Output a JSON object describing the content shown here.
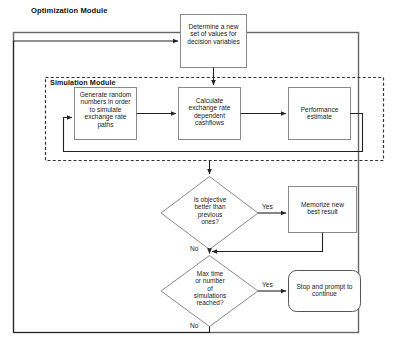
{
  "diagram": {
    "title_visible": false,
    "outer_module": {
      "label": "Optimization Module",
      "frame_color": "#555555"
    },
    "inner_module": {
      "label": "Simulation Module",
      "frame_color": "#333333",
      "frame_style": "dashed"
    },
    "nodes": {
      "determine": {
        "label": "Determine a new\nset of values for\ndecision variables",
        "shape": "rectangle"
      },
      "generate": {
        "label": "Generate random\nnumbers in order\nto simulate\nexchange rate\npaths",
        "shape": "rectangle"
      },
      "calculate": {
        "label": "Calculate\nexchange rate\ndependent\ncashflows",
        "shape": "rectangle"
      },
      "performance": {
        "label": "Performance\nestimate",
        "shape": "rectangle"
      },
      "objective_decision": {
        "label": "Is objective\nbetter than\nprevious\nones?",
        "shape": "diamond"
      },
      "memorize": {
        "label": "Memorize new\nbest result",
        "shape": "rectangle"
      },
      "maxtime_decision": {
        "label": "Max time\nor number\nof\nsimulations\nreached?",
        "shape": "diamond"
      },
      "stop": {
        "label": "Stop and prompt to\ncontinue",
        "shape": "rounded-rectangle"
      }
    },
    "edge_labels": {
      "objective_yes": "Yes",
      "objective_no": "No",
      "maxtime_yes": "Yes",
      "maxtime_no": "No"
    },
    "colors": {
      "background": "#ffffff",
      "stroke": "#222222",
      "box_stroke": "#7a7a7a",
      "text": "#222222"
    }
  }
}
